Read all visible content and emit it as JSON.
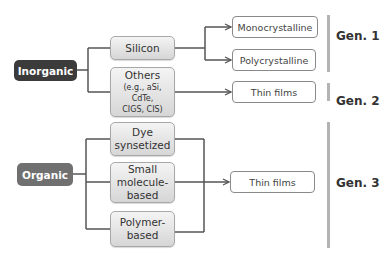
{
  "diagram": {
    "roots": {
      "inorganic": {
        "label": "Inorganic",
        "color": "#3b3b3b"
      },
      "organic": {
        "label": "Organic",
        "color": "#707070"
      }
    },
    "materials": {
      "silicon": {
        "label": "Silicon"
      },
      "others": {
        "label": "Others",
        "sub_lines": [
          "(e.g., aSi,",
          "CdTe,",
          "CIGS, CIS)"
        ]
      },
      "dye": {
        "lines": [
          "Dye",
          "synsetized"
        ]
      },
      "small_molecule": {
        "lines": [
          "Small",
          "molecule-",
          "based"
        ]
      },
      "polymer": {
        "lines": [
          "Polymer-",
          "based"
        ]
      }
    },
    "outputs": {
      "monocrystalline": "Monocrystalline",
      "polycrystalline": "Polycrystalline",
      "thin_films_gen2": "Thin films",
      "thin_films_gen3": "Thin films"
    },
    "generations": [
      {
        "label": "Gen. 1"
      },
      {
        "label": "Gen. 2"
      },
      {
        "label": "Gen. 3"
      }
    ],
    "colors": {
      "line": "#555555",
      "gen_bar": "#b3b3b3"
    }
  }
}
